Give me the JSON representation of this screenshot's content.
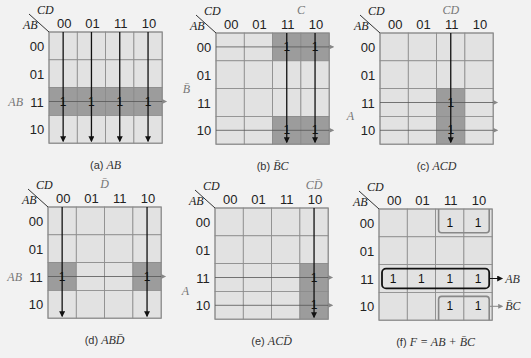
{
  "col_var": "CD",
  "row_var": "AB",
  "col_labels": [
    "00",
    "01",
    "11",
    "10"
  ],
  "row_labels": [
    "00",
    "01",
    "11",
    "10"
  ],
  "colors": {
    "background": "#f2f2f2",
    "cell": "#e2e2e2",
    "highlight": "#9c9c9c",
    "grid": "#8a8a8a",
    "line": "#111111"
  },
  "maps": [
    {
      "id": "a",
      "caption_prefix": "(a)",
      "caption_expr": "AB",
      "side_label": "AB",
      "side_label_row": 2,
      "top_label": "",
      "highlight": [
        [
          2,
          0
        ],
        [
          2,
          1
        ],
        [
          2,
          2
        ],
        [
          2,
          3
        ]
      ],
      "ones": [
        [
          2,
          0
        ],
        [
          2,
          1
        ],
        [
          2,
          2
        ],
        [
          2,
          3
        ]
      ],
      "vlines": [
        0,
        1,
        2,
        3
      ],
      "hlines": [
        2
      ]
    },
    {
      "id": "b",
      "caption_prefix": "(b)",
      "caption_expr": "B̄C",
      "side_label": "B̄",
      "side_label_row": 1.5,
      "top_label": "C",
      "top_label_col": 2.5,
      "highlight": [
        [
          0,
          2
        ],
        [
          0,
          3
        ],
        [
          3,
          2
        ],
        [
          3,
          3
        ]
      ],
      "ones": [
        [
          0,
          2
        ],
        [
          0,
          3
        ],
        [
          3,
          2
        ],
        [
          3,
          3
        ]
      ],
      "vlines": [
        2,
        3
      ],
      "hlines": [
        0,
        3
      ]
    },
    {
      "id": "c",
      "caption_prefix": "(c)",
      "caption_expr": "ACD",
      "side_label": "A",
      "side_label_row": 2.5,
      "top_label": "CD",
      "top_label_col": 2,
      "highlight": [
        [
          2,
          2
        ],
        [
          3,
          2
        ]
      ],
      "ones": [
        [
          2,
          2
        ],
        [
          3,
          2
        ]
      ],
      "vlines": [
        2
      ],
      "hlines": [
        2,
        3
      ]
    },
    {
      "id": "d",
      "caption_prefix": "(d)",
      "caption_expr": "ABD̄",
      "side_label": "AB",
      "side_label_row": 2,
      "top_label": "D̄",
      "top_label_col": 1.5,
      "highlight": [
        [
          2,
          0
        ],
        [
          2,
          3
        ]
      ],
      "ones": [
        [
          2,
          0
        ],
        [
          2,
          3
        ]
      ],
      "vlines": [
        0,
        3
      ],
      "hlines": [
        2
      ]
    },
    {
      "id": "e",
      "caption_prefix": "(e)",
      "caption_expr": "ACD̄",
      "side_label": "A",
      "side_label_row": 2.5,
      "top_label": "CD̄",
      "top_label_col": 3,
      "highlight": [
        [
          2,
          3
        ],
        [
          3,
          3
        ]
      ],
      "ones": [
        [
          2,
          3
        ],
        [
          3,
          3
        ]
      ],
      "vlines": [
        3
      ],
      "hlines": [
        2,
        3
      ]
    },
    {
      "id": "f",
      "caption_prefix": "(f)",
      "caption_expr": "F = AB + B̄C",
      "side_label": "",
      "top_label": "",
      "highlight": [],
      "ones": [
        [
          0,
          2
        ],
        [
          0,
          3
        ],
        [
          2,
          0
        ],
        [
          2,
          1
        ],
        [
          2,
          2
        ],
        [
          2,
          3
        ],
        [
          3,
          2
        ],
        [
          3,
          3
        ]
      ],
      "vlines": [],
      "hlines": [],
      "groups": [
        {
          "label": "AB",
          "row": 2,
          "cols": [
            0,
            3
          ],
          "style": "box"
        },
        {
          "label": "",
          "row": 0,
          "cols": [
            2,
            3
          ],
          "style": "bottom-open"
        },
        {
          "label": "B̄C",
          "row": 3,
          "cols": [
            2,
            3
          ],
          "style": "top-open"
        }
      ]
    }
  ]
}
